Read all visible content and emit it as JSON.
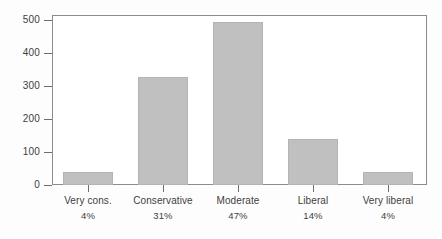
{
  "chart_data": {
    "type": "bar",
    "title": "",
    "subtitle": "",
    "xlabel": "",
    "ylabel": "",
    "categories": [
      "Very cons.",
      "Conservative",
      "Moderate",
      "Liberal",
      "Very liberal"
    ],
    "values": [
      40,
      330,
      500,
      140,
      40
    ],
    "percent_labels": [
      "4%",
      "31%",
      "47%",
      "14%",
      "4%"
    ],
    "ylim": [
      0,
      520
    ],
    "yticks": [
      0,
      100,
      200,
      300,
      400,
      500
    ],
    "ytick_labels": [
      "0",
      "100",
      "200",
      "300",
      "400",
      "500"
    ],
    "grid": false,
    "legend": "none",
    "bar_color": "#c0c0c0",
    "bar_border_color": "#b4b4b4",
    "frame_color": "#8c8c8c",
    "background_color": "#fdfdfd",
    "text_color": "#3d3d3d"
  }
}
